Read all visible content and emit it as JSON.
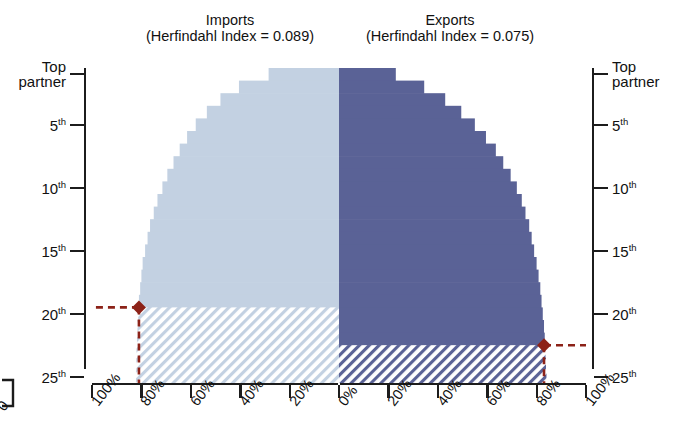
{
  "chart_data": {
    "type": "bar",
    "subtype": "back-to-back-horizontal-bar",
    "title": "",
    "panels": [
      {
        "name": "imports",
        "label": "Imports",
        "sublabel": "(Herfindahl Index = 0.089)",
        "herfindahl_index": 0.089,
        "direction": "left",
        "color": "#c3d1e2",
        "hatch_color": "#c3d1e2",
        "xlabel": "",
        "xlim": [
          0,
          100
        ],
        "xticks": [
          "100%",
          "80%",
          "60%",
          "40%",
          "20%",
          "0%"
        ],
        "xtick_values": [
          100,
          80,
          60,
          40,
          20,
          0
        ],
        "categories": [
          "Top partner",
          "2nd",
          "3rd",
          "4th",
          "5th",
          "6th",
          "7th",
          "8th",
          "9th",
          "10th",
          "11th",
          "12th",
          "13th",
          "14th",
          "15th",
          "16th",
          "17th",
          "18th",
          "19th",
          "20th",
          "21st",
          "22nd",
          "23rd",
          "24th",
          "25th"
        ],
        "values": [
          28.5,
          40.5,
          48.0,
          53.5,
          58.0,
          61.5,
          64.5,
          67.0,
          69.5,
          71.5,
          73.5,
          75.0,
          76.5,
          77.5,
          78.5,
          79.5,
          80.0,
          80.5,
          81.0,
          81.3,
          81.6,
          81.8,
          82.0,
          82.1,
          82.2
        ],
        "marker": {
          "label": "80% cumulative share",
          "rank_index": 18,
          "rank_label": "19th",
          "value": 81.0,
          "color": "#8c2218"
        },
        "hatched_from_rank_index": 19
      },
      {
        "name": "exports",
        "label": "Exports",
        "sublabel": "(Herfindahl Index = 0.075)",
        "herfindahl_index": 0.075,
        "direction": "right",
        "color": "#5a6296",
        "hatch_color": "#5a6296",
        "xlabel": "",
        "xlim": [
          0,
          100
        ],
        "xticks": [
          "0%",
          "20%",
          "40%",
          "60%",
          "80%",
          "100%"
        ],
        "xtick_values": [
          0,
          20,
          40,
          60,
          80,
          100
        ],
        "categories": [
          "Top partner",
          "2nd",
          "3rd",
          "4th",
          "5th",
          "6th",
          "7th",
          "8th",
          "9th",
          "10th",
          "11th",
          "12th",
          "13th",
          "14th",
          "15th",
          "16th",
          "17th",
          "18th",
          "19th",
          "20th",
          "21st",
          "22nd",
          "23rd",
          "24th",
          "25th"
        ],
        "values": [
          23.0,
          34.5,
          43.0,
          49.5,
          55.0,
          59.5,
          63.5,
          66.5,
          69.5,
          72.0,
          74.0,
          75.5,
          77.0,
          78.0,
          79.0,
          80.0,
          80.8,
          81.5,
          82.0,
          82.5,
          83.0,
          83.3,
          83.6,
          83.8,
          84.0
        ],
        "marker": {
          "label": "80% cumulative share",
          "rank_index": 21,
          "rank_label": "22nd",
          "value": 83.0,
          "color": "#8c2218"
        },
        "hatched_from_rank_index": 22
      }
    ],
    "yaxis": {
      "label": "",
      "ticks": [
        {
          "label": "Top",
          "label2": "partner",
          "rank": 1
        },
        {
          "label": "5",
          "suffix": "th",
          "rank": 5
        },
        {
          "label": "10",
          "suffix": "th",
          "rank": 10
        },
        {
          "label": "15",
          "suffix": "th",
          "rank": 15
        },
        {
          "label": "20",
          "suffix": "th",
          "rank": 20
        },
        {
          "label": "25",
          "suffix": "th",
          "rank": 25
        }
      ],
      "left_axis_title": "Top partner",
      "right_axis_title": "Top partner"
    },
    "legend": {
      "position": "none",
      "entries": []
    },
    "grid": false,
    "annotations": [
      "Imports (Herfindahl Index = 0.089)",
      "Exports (Herfindahl Index = 0.075)"
    ]
  },
  "axis_labels": {
    "y_top_line1": "Top",
    "y_top_line2": "partner",
    "y_5": "5",
    "y_10": "10",
    "y_15": "15",
    "y_20": "20",
    "y_25": "25",
    "ordinal_suffix": "th"
  },
  "xaxis_left_labels": [
    "100%",
    "80%",
    "60%",
    "40%",
    "20%",
    "0%"
  ],
  "xaxis_right_labels": [
    "0%",
    "20%",
    "40%",
    "60%",
    "80%",
    "100%"
  ],
  "stray_label": "0",
  "colors": {
    "imports_fill": "#c3d1e2",
    "exports_fill": "#5a6296",
    "marker": "#8c2218",
    "axis": "#1c1c1c",
    "text": "#111111",
    "background": "#ffffff"
  }
}
